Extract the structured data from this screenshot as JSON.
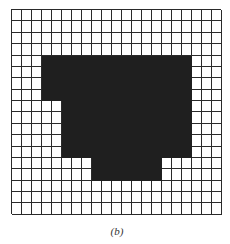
{
  "figure": {
    "caption": "(b)",
    "grid": {
      "columns": 21,
      "rows": 18,
      "line_color": "#2a2a2a",
      "fill_color": "#1f1f1f",
      "background_color": "#ffffff",
      "filled_regions": [
        {
          "row_start": 4,
          "row_end": 7,
          "col_start": 3,
          "col_end": 17
        },
        {
          "row_start": 8,
          "row_end": 12,
          "col_start": 5,
          "col_end": 17
        },
        {
          "row_start": 13,
          "row_end": 14,
          "col_start": 8,
          "col_end": 14
        }
      ]
    }
  }
}
